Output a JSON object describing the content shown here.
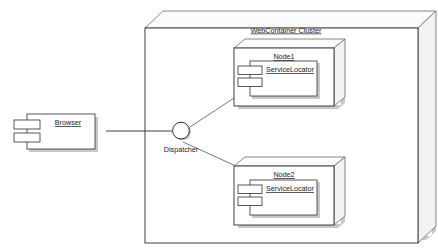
{
  "diagram": {
    "kind": "uml-deployment-diagram",
    "background_color": "#ffffff",
    "line_color": "#2b2b2b",
    "text_color": "#1a1a1a",
    "shadow_color": "#9a9a9a"
  },
  "cluster": {
    "label": "WebContainer Cluster",
    "underlined": true
  },
  "client": {
    "component_label": "Browser",
    "underlined": true
  },
  "dispatcher": {
    "label": "Dispatcher",
    "underlined": false,
    "shape": "interface-circle"
  },
  "nodes": [
    {
      "label": "Node1",
      "underlined": true,
      "component": {
        "label": "ServiceLocator",
        "underlined": true
      }
    },
    {
      "label": "Node2",
      "underlined": true,
      "component": {
        "label": "ServiceLocator",
        "underlined": true
      }
    }
  ],
  "connections": [
    {
      "from": "Browser",
      "to": "Dispatcher",
      "style": "solid"
    },
    {
      "from": "Dispatcher",
      "to": "Node1",
      "style": "solid"
    },
    {
      "from": "Dispatcher",
      "to": "Node2",
      "style": "solid"
    }
  ]
}
